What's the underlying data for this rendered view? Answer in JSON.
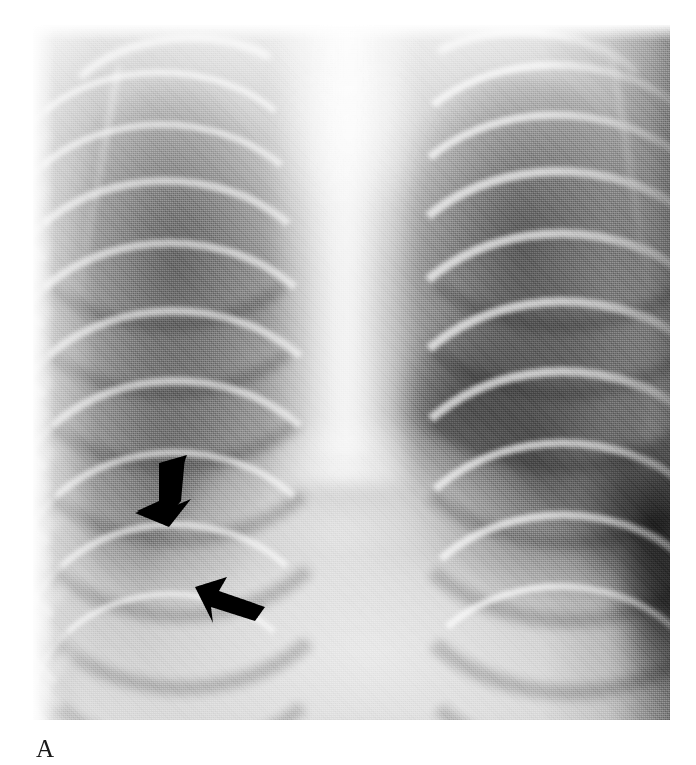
{
  "figure": {
    "panel_label": "A",
    "modality_name": "chest-radiograph",
    "view": "frontal",
    "background_color": "#ffffff",
    "film_tone_light": "#e9e9e9",
    "film_tone_mid": "#a8a8a8",
    "film_tone_dark": "#141414",
    "annotation_color": "#000000",
    "image_region": {
      "left": 33,
      "top": 25,
      "width": 637,
      "height": 695
    }
  },
  "annotations": {
    "arrows": [
      {
        "name": "arrow-upper",
        "icon": "arrow-down-left-icon",
        "left": 96,
        "top": 428,
        "width": 66,
        "height": 74,
        "rotation_deg": 200,
        "color": "#000000"
      },
      {
        "name": "arrow-lower",
        "icon": "arrow-up-left-icon",
        "left": 160,
        "top": 548,
        "width": 72,
        "height": 52,
        "rotation_deg": 160,
        "color": "#000000"
      }
    ]
  },
  "anatomy": {
    "regions": [
      {
        "name": "right-lung-field",
        "label": "right lung field"
      },
      {
        "name": "left-lung-field",
        "label": "left lung field"
      },
      {
        "name": "mediastinum",
        "label": "mediastinum"
      },
      {
        "name": "thymus-shadow",
        "label": "thymic shadow"
      },
      {
        "name": "spine",
        "label": "thoracic spine"
      },
      {
        "name": "cardiac-diaphragm-silhouette",
        "label": "cardiac and diaphragmatic silhouette"
      },
      {
        "name": "left-costophrenic-gutter",
        "label": "left lateral costophrenic gutter"
      },
      {
        "name": "chest-wall",
        "label": "soft tissue chest wall"
      }
    ],
    "right_ribs": [
      {
        "top": 44,
        "left": -30,
        "w": 300,
        "h": 220,
        "bw": 7
      },
      {
        "top": 96,
        "left": -34,
        "w": 312,
        "h": 236,
        "bw": 7
      },
      {
        "top": 152,
        "left": -36,
        "w": 322,
        "h": 250,
        "bw": 8
      },
      {
        "top": 214,
        "left": -36,
        "w": 330,
        "h": 262,
        "bw": 8
      },
      {
        "top": 282,
        "left": -34,
        "w": 334,
        "h": 270,
        "bw": 8
      },
      {
        "top": 352,
        "left": -30,
        "w": 330,
        "h": 272,
        "bw": 8
      },
      {
        "top": 424,
        "left": -24,
        "w": 318,
        "h": 266,
        "bw": 7
      },
      {
        "top": 496,
        "left": -16,
        "w": 300,
        "h": 252,
        "bw": 7
      },
      {
        "top": 566,
        "left": -6,
        "w": 276,
        "h": 232,
        "bw": 6
      }
    ],
    "left_ribs": [
      {
        "top": 36,
        "left": 356,
        "w": 316,
        "h": 226,
        "bw": 8
      },
      {
        "top": 86,
        "left": 350,
        "w": 330,
        "h": 244,
        "bw": 8
      },
      {
        "top": 142,
        "left": 346,
        "w": 342,
        "h": 258,
        "bw": 9
      },
      {
        "top": 204,
        "left": 344,
        "w": 350,
        "h": 272,
        "bw": 9
      },
      {
        "top": 272,
        "left": 344,
        "w": 354,
        "h": 282,
        "bw": 9
      },
      {
        "top": 342,
        "left": 346,
        "w": 350,
        "h": 284,
        "bw": 9
      },
      {
        "top": 414,
        "left": 352,
        "w": 340,
        "h": 278,
        "bw": 8
      },
      {
        "top": 486,
        "left": 360,
        "w": 324,
        "h": 264,
        "bw": 8
      },
      {
        "top": 558,
        "left": 370,
        "w": 300,
        "h": 244,
        "bw": 7
      }
    ]
  }
}
